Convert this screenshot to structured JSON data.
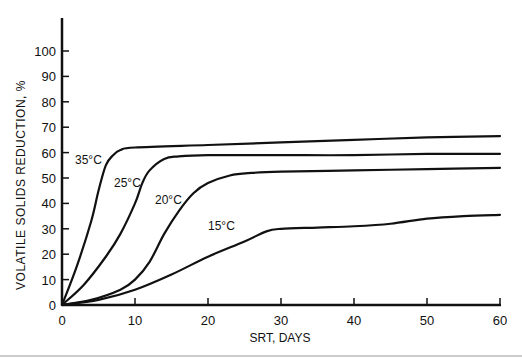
{
  "chart_data": {
    "type": "line",
    "title": "",
    "xlabel": "SRT, DAYS",
    "ylabel": "VOLATILE SOLIDS REDUCTION, %",
    "xlim": [
      0,
      60
    ],
    "ylim": [
      0,
      100
    ],
    "xticks": [
      0,
      10,
      20,
      30,
      40,
      50,
      60
    ],
    "yticks": [
      0,
      10,
      20,
      30,
      40,
      50,
      60,
      70,
      80,
      90,
      100
    ],
    "grid": false,
    "legend": "inline labels on curves",
    "series": [
      {
        "name": "35°C",
        "x": [
          0,
          2,
          4,
          5,
          6,
          7,
          8,
          10,
          20,
          30,
          40,
          50,
          60
        ],
        "y": [
          0,
          15,
          33,
          45,
          55,
          59,
          61,
          62,
          63,
          64,
          65,
          66,
          66.5
        ]
      },
      {
        "name": "25°C",
        "x": [
          0,
          3,
          6,
          8,
          10,
          11,
          12,
          14,
          16,
          20,
          30,
          40,
          50,
          60
        ],
        "y": [
          0,
          8,
          19,
          28,
          40,
          48,
          53,
          57.5,
          58.5,
          59,
          59,
          59,
          59.5,
          59.5
        ]
      },
      {
        "name": "20°C",
        "x": [
          0,
          4,
          8,
          10,
          12,
          14,
          16,
          18,
          20,
          23,
          26,
          30,
          40,
          50,
          60
        ],
        "y": [
          0,
          2,
          6,
          10,
          17,
          28,
          37,
          44,
          48,
          51,
          52,
          52.5,
          53,
          53.5,
          54
        ]
      },
      {
        "name": "15°C",
        "x": [
          0,
          5,
          10,
          15,
          20,
          25,
          28,
          30,
          35,
          40,
          45,
          50,
          55,
          60
        ],
        "y": [
          0,
          2,
          6,
          12,
          19,
          25,
          29,
          30,
          30.5,
          31,
          32,
          34,
          35,
          35.5
        ]
      }
    ]
  },
  "labels": {
    "ylabel": "VOLATILE SOLIDS REDUCTION, %",
    "xlabel": "SRT, DAYS",
    "curve35": "35°C",
    "curve25": "25°C",
    "curve20": "20°C",
    "curve15": "15°C"
  }
}
